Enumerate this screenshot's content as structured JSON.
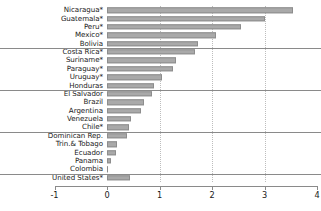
{
  "chart_data": {
    "type": "bar",
    "orientation": "horizontal",
    "title": "",
    "subtitle": "",
    "xlabel": "",
    "ylabel": "",
    "xlim": [
      -1,
      4
    ],
    "ylim": null,
    "grid": "vertical-dotted-at-integer-ticks",
    "legend": null,
    "xticks": [
      -1,
      0,
      1,
      2,
      3,
      4
    ],
    "xtick_labels": [
      "-1",
      "0",
      "1",
      "2",
      "3",
      "4"
    ],
    "bar_color": "#a9a9a9",
    "bar_edge_color": "#8d8d8d",
    "categories": [
      "Nicaragua*",
      "Guatemala*",
      "Peru*",
      "Mexico*",
      "Bolivia",
      "Costa Rica*",
      "Suriname*",
      "Paraguay*",
      "Uruguay*",
      "Honduras",
      "El Salvador",
      "Brazil",
      "Argentina",
      "Venezuela",
      "Chile*",
      "Dominican Rep.",
      "Trin.& Tobago",
      "Ecuador",
      "Panama",
      "Colombia",
      "United States*"
    ],
    "values": [
      3.55,
      3.0,
      2.55,
      2.07,
      1.73,
      1.67,
      1.32,
      1.25,
      1.04,
      0.9,
      0.86,
      0.71,
      0.64,
      0.45,
      0.41,
      0.38,
      0.19,
      0.17,
      0.08,
      0.02,
      0.43
    ],
    "group_separators_after": [
      "Bolivia",
      "Honduras",
      "Chile*",
      "Colombia"
    ]
  }
}
